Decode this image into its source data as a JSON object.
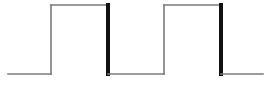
{
  "diagram": {
    "type": "square-wave",
    "colors": {
      "background": "#ffffff",
      "line": "#7a7a7a",
      "edge_emphasis": "#111111"
    },
    "baseline_y": 74,
    "high_y": 5,
    "start_x": 8,
    "end_x": 263,
    "pulses": [
      {
        "rise_x": 51,
        "fall_x": 108
      },
      {
        "rise_x": 164,
        "fall_x": 221
      }
    ]
  }
}
